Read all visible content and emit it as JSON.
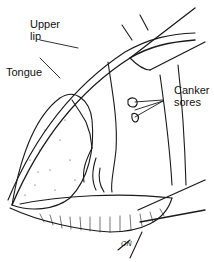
{
  "figure": {
    "labels": {
      "upper_lip": [
        "Upper",
        "lip"
      ],
      "tongue": "Tongue",
      "canker_sores": [
        "Canker",
        "sores"
      ]
    },
    "signature": "ON",
    "colors": {
      "ink": "#1a1a1a",
      "background": "#ffffff"
    }
  }
}
